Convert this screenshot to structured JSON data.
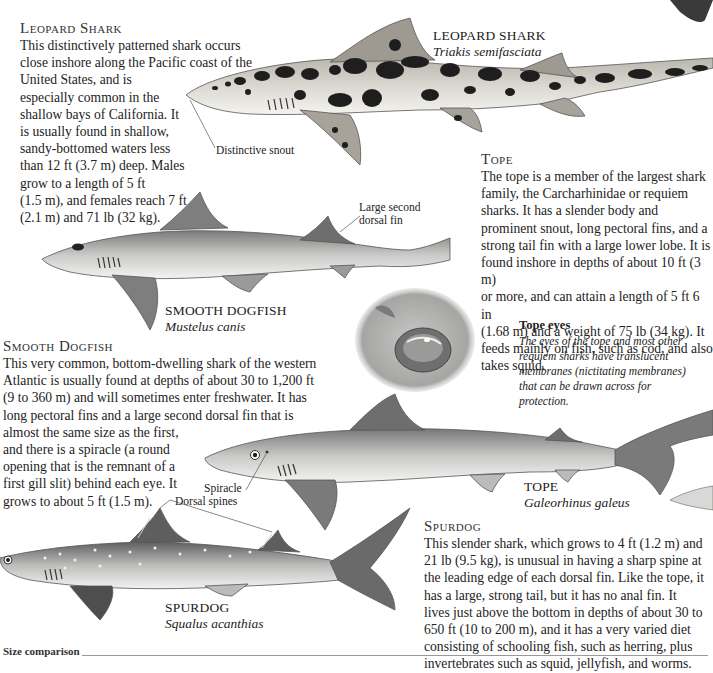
{
  "leopard_shark": {
    "heading": "Leopard Shark",
    "text_lines": [
      "This distinctively patterned shark occurs",
      "close inshore along the Pacific coast of the",
      "United States, and is",
      "especially common in the",
      "shallow bays of California. It",
      "is usually found in shallow,",
      "sandy-bottomed waters less",
      "than 12 ft (3.7 m) deep. Males",
      "grow to a length of 5 ft",
      "(1.5 m), and females reach 7 ft",
      "(2.1 m) and 71 lb (32 kg)."
    ],
    "label_name": "LEOPARD SHARK",
    "label_latin": "Triakis semifasciata",
    "annotation": "Distinctive snout"
  },
  "tope": {
    "heading": "Tope",
    "text_lines": [
      "The tope is a member of the largest shark",
      "family, the Carcharhinidae or requiem",
      "sharks. It has a slender body and",
      "prominent snout, long pectoral fins, and a",
      "strong tail fin with a large lower lobe. It is",
      "found inshore in depths of about 10 ft (3 m)",
      "or more, and can attain a length of 5 ft 6 in",
      "(1.68 m) and a weight of 75 lb (34 kg). It",
      "feeds mainly on fish, such as cod, and also",
      "takes squid."
    ],
    "label_name": "TOPE",
    "label_latin": "Galeorhinus galeus",
    "annotation": "Spiracle"
  },
  "tope_eyes": {
    "title": "Tope eyes",
    "text_lines": [
      "The eyes of the tope and most other",
      "requiem sharks have translucent",
      "membranes (nictitating membranes)",
      "that can be drawn across for",
      "protection."
    ]
  },
  "smooth_dogfish": {
    "heading": "Smooth Dogfish",
    "text_lines": [
      "This very common, bottom-dwelling shark of the western",
      "Atlantic is usually found at depths of about 30 to 1,200 ft",
      "(9 to 360 m) and will sometimes enter freshwater. It has",
      "long pectoral fins and a large second dorsal fin that is",
      "almost the same size as the first,",
      "and there is a spiracle (a round",
      "opening that is the remnant of a",
      "first gill slit) behind each eye. It",
      "grows to about 5 ft (1.5 m)."
    ],
    "label_name": "SMOOTH DOGFISH",
    "label_latin": "Mustelus canis",
    "annotation_lines": [
      "Large second",
      "dorsal fin"
    ]
  },
  "spurdog": {
    "heading": "Spurdog",
    "text_lines": [
      "This slender shark, which grows to 4 ft (1.2 m) and",
      "21 lb (9.5 kg), is unusual in having a sharp spine at",
      "the leading edge of each dorsal fin. Like the tope, it",
      "has a large, strong tail, but it has no anal fin. It",
      "lives just above the bottom in depths of about 30 to",
      "650 ft (10 to 200 m), and it has a very varied diet",
      "consisting of schooling fish, such as herring, plus",
      "invertebrates such as squid, jellyfish, and worms."
    ],
    "label_name": "SPURDOG",
    "label_latin": "Squalus acanthias",
    "annotation": "Dorsal spines"
  },
  "size_comparison": {
    "label": "Size comparison"
  },
  "colors": {
    "leopard_body": "#dcdcd8",
    "leopard_spot": "#1e1e1e",
    "shark_gray": "#8a8a8a",
    "shark_belly": "#f2f2f0",
    "rule": "#999999"
  }
}
